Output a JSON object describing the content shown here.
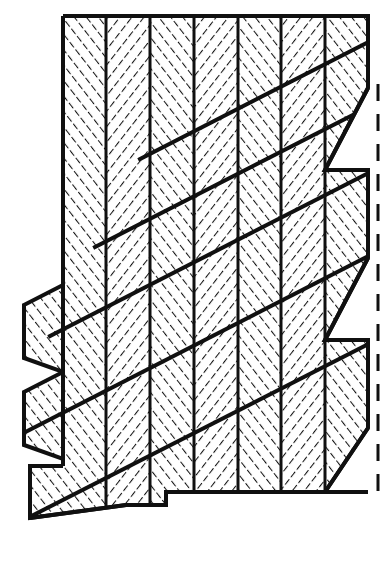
{
  "figure": {
    "title": "Stepped scarf joint in hatched laminate",
    "kind": "technical-line-drawing",
    "background_color": "#ffffff",
    "ink_color": "#101010",
    "canvas": {
      "width": 388,
      "height": 565
    }
  },
  "style": {
    "outline_stroke_width": 4.0,
    "ply_divider_stroke_width": 3.0,
    "scarf_stroke_width": 4.0,
    "dashed_stroke_width": 3.0,
    "dash_pattern": "17 13",
    "hatch_stroke_width": 2.1,
    "hatch_spacing": 9.5,
    "hatch_angle_a_deg": -38,
    "hatch_angle_b_deg": 38
  },
  "body": {
    "top_edge_y": 16,
    "left_edge_x": 63,
    "right_edge_x": 368,
    "bottom_edge_y": 492,
    "outline_points": "63,16 368,16 368,492 166,492 166,505 126,505 30,518 30,466 63,466"
  },
  "plies": {
    "count": 7,
    "label": "vertical plies",
    "divider_x": [
      106,
      150,
      194,
      238,
      281,
      325
    ],
    "hatch_directions": [
      "a",
      "b",
      "a",
      "b",
      "a",
      "b",
      "a"
    ]
  },
  "scarf": {
    "label": "scarf diagonals",
    "angle_deg": -27,
    "lines": [
      {
        "x1": 20,
        "y1": 518,
        "x2": 368,
        "y2": 340
      },
      {
        "x1": 20,
        "y1": 432,
        "x2": 368,
        "y2": 250
      },
      {
        "x1": 63,
        "y1": 328,
        "x2": 368,
        "y2": 172
      },
      {
        "x1": 106,
        "y1": 240,
        "x2": 368,
        "y2": 106
      },
      {
        "x1": 150,
        "y1": 152,
        "x2": 368,
        "y2": 40
      }
    ]
  },
  "left_tabs": {
    "label": "protruding step tabs",
    "tabs": [
      {
        "name": "tab-upper",
        "points": "24,305 63,285 63,372 24,358"
      },
      {
        "name": "tab-lower",
        "points": "24,392 63,372 63,459 24,445"
      }
    ]
  },
  "right_notches": {
    "label": "stepped notches at centerline",
    "notches": [
      {
        "name": "notch-1",
        "points": "368,88 368,170 325,170"
      },
      {
        "name": "notch-2",
        "points": "368,258 368,340 325,340"
      },
      {
        "name": "notch-3",
        "points": "368,428 368,492 325,492"
      }
    ]
  },
  "centerline": {
    "label": "dashed centerline",
    "x": 378,
    "y_top": 84,
    "y_bottom": 500
  },
  "bottom_step": {
    "label": "bottom stepped cut",
    "points": "30,518 126,505 166,505 166,492"
  }
}
